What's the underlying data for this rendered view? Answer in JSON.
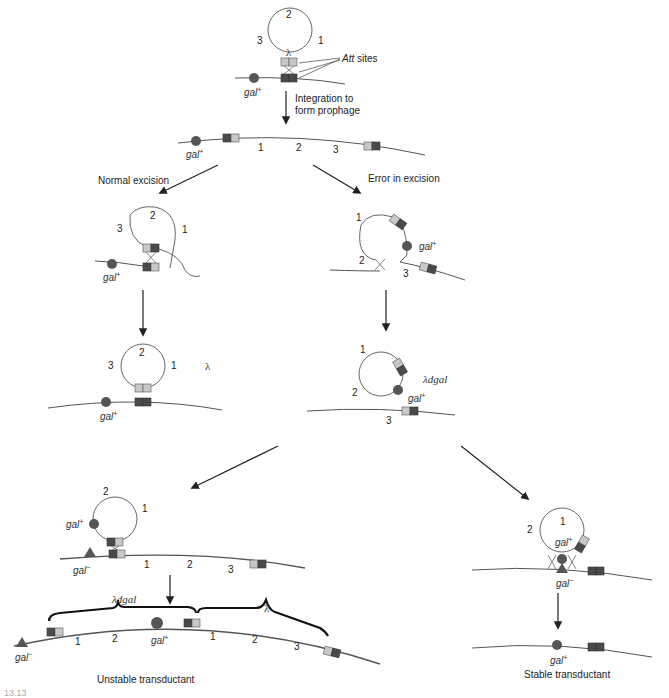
{
  "colors": {
    "background": "#ffffff",
    "dna_strand": "#555555",
    "att_dark": "#4a4a4a",
    "att_light": "#c8c8c8",
    "gal_plus_marker": "#555555",
    "gal_minus_marker": "#555555",
    "arrow": "#222222"
  },
  "labels": {
    "lambda": "λ",
    "att_sites": "Att",
    "att_sites_suffix": " sites",
    "gal_plus": "gal+",
    "gal_minus": "gal−",
    "lambda_dgal": "λdgal",
    "integration": "Integration to",
    "integration_line2": "form prophage",
    "normal_excision": "Normal excision",
    "error_excision": "Error in excision",
    "unstable_transductant": "Unstable transductant",
    "stable_transductant": "Stable transductant"
  },
  "gene_numbers": {
    "one": "1",
    "two": "2",
    "three": "3"
  },
  "stages": [
    {
      "id": "phage-attachment",
      "description": "Circular lambda with att sites aligning to bacterial chromosome near gal+"
    },
    {
      "id": "prophage",
      "description": "Integrated prophage genes 1 2 3 flanked by att sites"
    },
    {
      "id": "normal-excision",
      "description": "Looping out at att sites"
    },
    {
      "id": "error-excision",
      "description": "Aberrant looping including gal+"
    },
    {
      "id": "lambda-free",
      "description": "Free lambda phage and chromosome with gal+"
    },
    {
      "id": "lambda-dgal",
      "description": "λdgal particle carrying gal+, chromosome missing 1 2"
    },
    {
      "id": "unstable-integration",
      "description": "λdgal integrates into gal− recipient with helper lambda"
    },
    {
      "id": "unstable-transductant",
      "description": "Tandem λdgal and λ prophages"
    },
    {
      "id": "stable-integration",
      "description": "Double crossover replaces gal− with gal+"
    },
    {
      "id": "stable-transductant",
      "description": "Chromosome carries gal+"
    }
  ],
  "caption_fragment": "13.13"
}
